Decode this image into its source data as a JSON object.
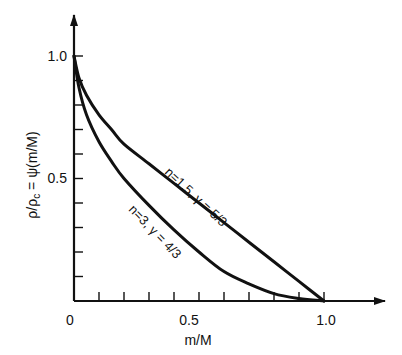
{
  "chart_data": {
    "type": "line",
    "title": "",
    "xlabel": "m/M",
    "ylabel": "ρ/ρc = ψ(m/M)",
    "ylabel_parts": {
      "rho": "ρ/ρ",
      "sub": "c",
      "rest": " = ψ(m/M)"
    },
    "xlim": [
      0,
      1.2
    ],
    "ylim": [
      0,
      1.15
    ],
    "x_ticks": [
      0,
      0.1,
      0.2,
      0.3,
      0.4,
      0.5,
      0.6,
      0.7,
      0.8,
      0.9,
      1.0
    ],
    "x_tick_labels": {
      "0": "0",
      "0.5": "0.5",
      "1.0": "1.0"
    },
    "y_ticks": [
      0,
      0.1,
      0.2,
      0.3,
      0.4,
      0.5,
      0.6,
      0.7,
      0.8,
      0.9,
      1.0
    ],
    "y_tick_labels": {
      "0.5": "0.5",
      "1.0": "1.0"
    },
    "grid": false,
    "legend": "inline curve labels",
    "series": [
      {
        "name": "n=1.5, γ=5/3",
        "label": "n=1.5,  γ = 5/3",
        "x": [
          0.0,
          0.02,
          0.05,
          0.1,
          0.15,
          0.2,
          0.3,
          0.4,
          0.5,
          0.6,
          0.7,
          0.8,
          0.9,
          1.0
        ],
        "y": [
          1.0,
          0.91,
          0.84,
          0.76,
          0.7,
          0.64,
          0.56,
          0.48,
          0.4,
          0.32,
          0.24,
          0.16,
          0.08,
          0.0
        ]
      },
      {
        "name": "n=3, γ=4/3",
        "label": "n=3,  γ = 4/3",
        "x": [
          0.0,
          0.02,
          0.05,
          0.1,
          0.15,
          0.2,
          0.3,
          0.4,
          0.5,
          0.6,
          0.7,
          0.8,
          0.9,
          1.0
        ],
        "y": [
          1.0,
          0.87,
          0.76,
          0.65,
          0.57,
          0.5,
          0.39,
          0.29,
          0.2,
          0.12,
          0.07,
          0.03,
          0.01,
          0.0
        ]
      }
    ]
  },
  "axes": {
    "origin_label": "0",
    "x_mid_label": "0.5",
    "x_end_label": "1.0",
    "y_mid_label": "0.5",
    "y_top_label": "1.0",
    "x_title": "m/M"
  },
  "labels": {
    "curve1": "n=1.5,  γ = 5/3",
    "curve2": "n=3,  γ = 4/3"
  },
  "colors": {
    "ink": "#111111",
    "background": "#ffffff"
  }
}
